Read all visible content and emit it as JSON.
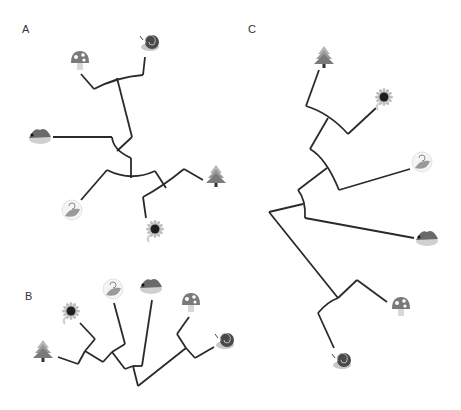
{
  "figure": {
    "width": 461,
    "height": 410,
    "background": "#ffffff",
    "branch_color": "#2a2a2a"
  },
  "panels": [
    {
      "id": "A",
      "label": "A",
      "label_pos": [
        22,
        24
      ],
      "branches": [
        "M81,74 L94,89",
        "M94,89 Q117,77 143,75",
        "M143,75 L145,57",
        "M117,78 L132,137",
        "M132,137 L117,151",
        "M112,137 Q113,150 131,158",
        "M53,137 L112,137",
        "M131,158 L131,178",
        "M107,170 Q131,182 155,171",
        "M107,170 L81,200",
        "M155,171 L166,188",
        "M143,197 Q162,187 184,169",
        "M184,169 L203,180",
        "M143,197 L146,218"
      ],
      "leaves": [
        {
          "icon": "mushroom-icon",
          "x": 80,
          "y": 60
        },
        {
          "icon": "snail-icon",
          "x": 150,
          "y": 42
        },
        {
          "icon": "hedgehog-icon",
          "x": 40,
          "y": 136
        },
        {
          "icon": "leaf-icon",
          "x": 72,
          "y": 210
        },
        {
          "icon": "tree-icon",
          "x": 216,
          "y": 176
        },
        {
          "icon": "sunflower-icon",
          "x": 155,
          "y": 229
        }
      ]
    },
    {
      "id": "B",
      "label": "B",
      "label_pos": [
        25,
        291
      ],
      "branches": [
        "M58,357 L78,364",
        "M78,364 L85,351",
        "M85,351 L95,339",
        "M95,339 L80,323",
        "M85,351 L103,362",
        "M103,362 L112,352",
        "M112,352 L125,344",
        "M125,344 L114,303",
        "M112,352 L125,369",
        "M125,369 L133,366",
        "M133,366 L142,366",
        "M142,366 L152,300",
        "M133,366 L138,386",
        "M138,386 L186,348",
        "M186,348 L177,334",
        "M177,334 L189,317",
        "M186,348 L195,358",
        "M195,358 L214,347"
      ],
      "leaves": [
        {
          "icon": "tree-icon",
          "x": 43,
          "y": 351
        },
        {
          "icon": "sunflower-icon",
          "x": 71,
          "y": 311
        },
        {
          "icon": "leaf-icon",
          "x": 113,
          "y": 289
        },
        {
          "icon": "hedgehog-icon",
          "x": 151,
          "y": 286
        },
        {
          "icon": "mushroom-icon",
          "x": 191,
          "y": 302
        },
        {
          "icon": "snail-icon",
          "x": 225,
          "y": 340
        }
      ]
    },
    {
      "id": "C",
      "label": "C",
      "label_pos": [
        248,
        24
      ],
      "branches": [
        "M319,70 L306,106",
        "M306,106 Q329,113 348,134",
        "M348,134 L376,108",
        "M328,118 L310,149",
        "M310,149 Q326,158 339,190",
        "M339,190 L410,169",
        "M327,168 L298,190",
        "M298,190 Q306,200 305,218",
        "M303,204 L269,212",
        "M305,218 L414,238",
        "M269,212 L338,298",
        "M318,313 Q327,302 338,298",
        "M338,298 L357,280",
        "M357,280 L387,302",
        "M318,313 L334,348"
      ],
      "leaves": [
        {
          "icon": "tree-icon",
          "x": 324,
          "y": 57
        },
        {
          "icon": "sunflower-icon",
          "x": 384,
          "y": 97
        },
        {
          "icon": "leaf-icon",
          "x": 422,
          "y": 162
        },
        {
          "icon": "hedgehog-icon",
          "x": 427,
          "y": 238
        },
        {
          "icon": "mushroom-icon",
          "x": 401,
          "y": 306
        },
        {
          "icon": "snail-icon",
          "x": 342,
          "y": 360
        }
      ]
    }
  ],
  "icons": {
    "snail-icon": {
      "name": "snail",
      "shell": "#4a4a4a",
      "body": "#c8c8c8"
    },
    "mushroom-icon": {
      "name": "mushroom",
      "cap": "#7a7a7a",
      "spots": "#ffffff",
      "stem": "#d8d8d8"
    },
    "hedgehog-icon": {
      "name": "hedgehog",
      "body": "#6a6a6a",
      "belly": "#d0d0d0"
    },
    "leaf-icon": {
      "name": "leaf",
      "leaf": "#9a9a9a",
      "curl": "#8a8a8a"
    },
    "tree-icon": {
      "name": "pine tree",
      "top": "#b8b8b8",
      "bottom": "#7a7a7a",
      "trunk": "#333333"
    },
    "sunflower-icon": {
      "name": "sunflower",
      "center": "#1e1e1e",
      "petals": "#bdbdbd",
      "stem": "#cfcfcf"
    }
  }
}
